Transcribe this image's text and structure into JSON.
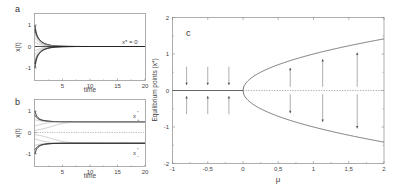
{
  "chart_data": [
    {
      "panel": "a",
      "type": "line",
      "title": "",
      "panel_label": "a",
      "xlabel": "time",
      "ylabel": "x(t)",
      "xlim": [
        0,
        20
      ],
      "ylim": [
        -1.5,
        1.5
      ],
      "xticks": [
        5,
        10,
        15,
        20
      ],
      "yticks": [
        -1,
        0,
        1
      ],
      "grid": false,
      "annotation": "x* = 0",
      "description": "Trajectories x(t) for mu<0 starting from initial conditions in [-1,1] all decaying to the single stable equilibrium x*=0",
      "initial_conditions": [
        1.0,
        0.8,
        0.6,
        0.4,
        0.2,
        -0.2,
        -0.4,
        -0.6,
        -0.8,
        -1.0
      ],
      "mu": -0.5
    },
    {
      "panel": "b",
      "type": "line",
      "title": "",
      "panel_label": "b",
      "xlabel": "time",
      "ylabel": "x(t)",
      "xlim": [
        0,
        20
      ],
      "ylim": [
        -1.5,
        1.5
      ],
      "xticks": [
        5,
        10,
        15,
        20
      ],
      "yticks": [
        -1,
        0,
        1
      ],
      "grid": false,
      "annotations": [
        "x*+",
        "x*-"
      ],
      "description": "Trajectories x(t) for mu>0 converging to stable equilibria x*+ ~ 0.5 and x*- ~ -0.5; x=0 unstable (dotted)",
      "initial_conditions": [
        1.0,
        0.8,
        0.6,
        0.3,
        0.1,
        -0.1,
        -0.3,
        -0.6,
        -0.8,
        -1.0
      ],
      "mu": 0.25,
      "equilibria": [
        0.5,
        0,
        -0.5
      ]
    },
    {
      "panel": "c",
      "type": "line",
      "title": "",
      "panel_label": "c",
      "xlabel": "μ",
      "ylabel": "Equilibrium points (x*)",
      "xlim": [
        -1,
        2
      ],
      "ylim": [
        -2,
        2
      ],
      "xticks": [
        "-1",
        "-0,5",
        "0",
        "0,5",
        "1",
        "1,5",
        "2"
      ],
      "xtick_values": [
        -1,
        -0.5,
        0,
        0.5,
        1,
        1.5,
        2
      ],
      "yticks": [
        -2,
        -1,
        0,
        1,
        2
      ],
      "grid": false,
      "series": [
        {
          "name": "stable x*=0 (mu<0)",
          "style": "solid",
          "x": [
            -1,
            0
          ],
          "y": [
            0,
            0
          ]
        },
        {
          "name": "unstable x*=0 (mu>0)",
          "style": "dashed",
          "x": [
            0,
            2
          ],
          "y": [
            0,
            0
          ]
        },
        {
          "name": "stable x*+ = sqrt(mu)",
          "style": "solid",
          "x": [
            0,
            0.25,
            0.5,
            1,
            1.5,
            2
          ],
          "y": [
            0,
            0.5,
            0.71,
            1,
            1.22,
            1.41
          ]
        },
        {
          "name": "stable x*- = -sqrt(mu)",
          "style": "solid",
          "x": [
            0,
            0.25,
            0.5,
            1,
            1.5,
            2
          ],
          "y": [
            0,
            -0.5,
            -0.71,
            -1,
            -1.22,
            -1.41
          ]
        }
      ],
      "arrows": [
        {
          "mu": -0.8,
          "from": 0.65,
          "to": 0.15
        },
        {
          "mu": -0.5,
          "from": 0.65,
          "to": 0.15
        },
        {
          "mu": -0.2,
          "from": 0.65,
          "to": 0.15
        },
        {
          "mu": -0.8,
          "from": -0.65,
          "to": -0.15
        },
        {
          "mu": -0.5,
          "from": -0.65,
          "to": -0.15
        },
        {
          "mu": -0.2,
          "from": -0.65,
          "to": -0.15
        },
        {
          "mu": 0.67,
          "from": 0.1,
          "to": 0.62
        },
        {
          "mu": 1.13,
          "from": 0.1,
          "to": 0.86
        },
        {
          "mu": 1.62,
          "from": 0.1,
          "to": 1.04
        },
        {
          "mu": 0.67,
          "from": -0.1,
          "to": -0.62
        },
        {
          "mu": 1.13,
          "from": -0.1,
          "to": -0.86
        },
        {
          "mu": 1.62,
          "from": -0.1,
          "to": -1.04
        }
      ]
    }
  ],
  "labels": {
    "a_annotation": "x* = 0",
    "b_xplus": "x",
    "b_xplus_sub": "+",
    "b_xminus": "x",
    "b_xminus_sub": "−",
    "star": "*"
  },
  "colors": {
    "axis": "#888888",
    "curve": "#555555",
    "trajectory_dark": "#222222",
    "trajectory_light": "#9a9a9a",
    "text": "#444444"
  }
}
